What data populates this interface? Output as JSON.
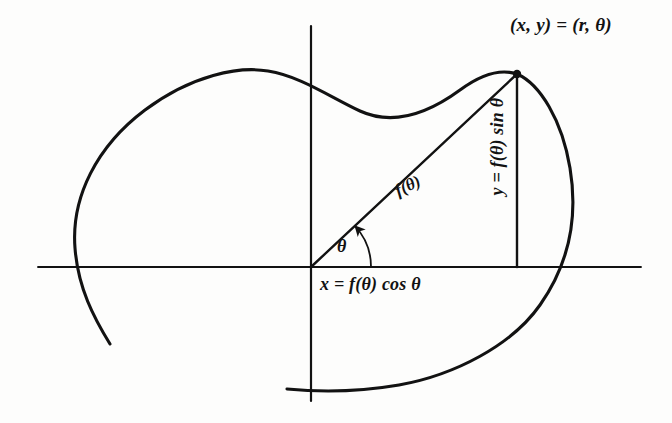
{
  "figure": {
    "kind": "polar-coordinates-diagram",
    "background_color": "#fdfdfc",
    "ink_color": "#121212"
  },
  "labels": {
    "point": "(x, y) = (r, θ)",
    "x_component": "x = f(θ) cos θ",
    "y_component": "y = f(θ) sin θ",
    "radius": "f(θ)",
    "angle": "θ"
  },
  "axes": {
    "origin": [
      311,
      267
    ],
    "x_axis": {
      "x1": 38,
      "y1": 267,
      "x2": 641,
      "y2": 267
    },
    "y_axis": {
      "x1": 311,
      "y1": 26,
      "x2": 311,
      "y2": 401
    }
  },
  "geometry": {
    "point_on_curve": [
      517,
      74
    ],
    "radius_line": {
      "x1": 311,
      "y1": 267,
      "x2": 517,
      "y2": 74
    },
    "y_drop_line": {
      "x1": 517,
      "y1": 74,
      "x2": 517,
      "y2": 267
    },
    "angle_arc": {
      "cx": 311,
      "cy": 267,
      "r": 60,
      "start_deg": 0,
      "end_deg": 43
    }
  },
  "curve": {
    "description": "open polar curve r = f(θ), heart/cardioid-like lobe",
    "start_point": [
      110,
      344
    ],
    "end_point": [
      287,
      389
    ],
    "path": "M 110 344 C 94 318 78 288 75 248 C 71 197 97 146 145 110 C 192 75 239 66 268 71 C 300 76 330 97 360 111 C 395 127 430 112 460 90 C 487 70 505 70 517 74 C 540 84 562 120 570 168 C 579 222 566 268 540 305 C 512 345 455 375 399 385 C 358 392 318 392 287 389"
  }
}
